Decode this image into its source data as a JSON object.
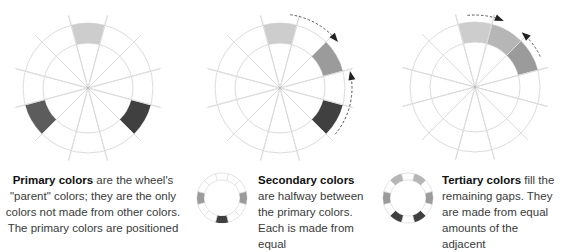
{
  "colors": {
    "grid": "#dcdcdc",
    "primary_top": "#cdcdcd",
    "primary_left": "#5c5c5c",
    "primary_right": "#404040",
    "secondary": "#9b9b9b",
    "tertiary": "#b6b6b6",
    "arrow": "#222222"
  },
  "panels": [
    {
      "id": "primary",
      "title": "Primary colors",
      "text": " are the wheel's \"parent\" colors; they are the only colors not made from other colors. The primary colors are positioned"
    },
    {
      "id": "secondary",
      "title": "Secondary colors",
      "text": " are halfway between the primary colors. Each is made from equal"
    },
    {
      "id": "tertiary",
      "title": "Tertiary colors",
      "text": " fill the remaining gaps. They are made from equal amounts of the adjacent"
    }
  ]
}
